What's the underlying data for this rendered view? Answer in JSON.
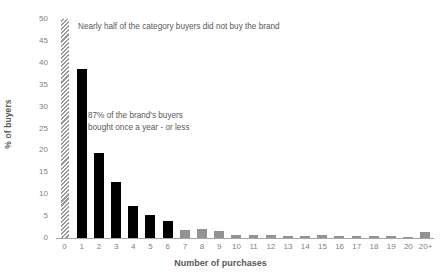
{
  "chart_data": {
    "type": "bar",
    "title": "",
    "xlabel": "Number of purchases",
    "ylabel": "% of buyers",
    "categories": [
      "0",
      "1",
      "2",
      "3",
      "4",
      "5",
      "6",
      "7",
      "8",
      "9",
      "10",
      "11",
      "12",
      "13",
      "14",
      "15",
      "16",
      "17",
      "18",
      "19",
      "20",
      "20+"
    ],
    "values": [
      50,
      38.5,
      19.5,
      12.7,
      7.3,
      5.3,
      3.8,
      1.8,
      2.0,
      1.5,
      0.8,
      0.6,
      0.8,
      0.5,
      0.4,
      0.7,
      0.4,
      0.35,
      0.4,
      0.35,
      0.3,
      1.3
    ],
    "bar_styles": [
      "hatched",
      "black",
      "black",
      "black",
      "black",
      "black",
      "black",
      "gray",
      "gray",
      "gray",
      "gray",
      "gray",
      "gray",
      "gray",
      "gray",
      "gray",
      "gray",
      "gray",
      "gray",
      "gray",
      "gray",
      "gray"
    ],
    "ylim": [
      0,
      50
    ],
    "y_ticks": [
      "0",
      "5",
      "10",
      "15",
      "20",
      "25",
      "30",
      "35",
      "40",
      "45",
      "50"
    ],
    "y_tick_values": [
      0,
      5,
      10,
      15,
      20,
      25,
      30,
      35,
      40,
      45,
      50
    ],
    "grid": false,
    "legend": "none",
    "colors": {
      "bar_black": "#000000",
      "bar_gray": "#939393",
      "hatch": "#9a9a9a",
      "axis": "#a6a6a6",
      "tick_text": "#7f7f7f",
      "title_text": "#595959"
    },
    "annotations": [
      {
        "id": "annotation-top",
        "text": "Nearly half of the category buyers did not buy the brand"
      },
      {
        "id": "annotation-mid",
        "text": "87% of the brand's buyers\nbought once a year - or less"
      }
    ]
  }
}
